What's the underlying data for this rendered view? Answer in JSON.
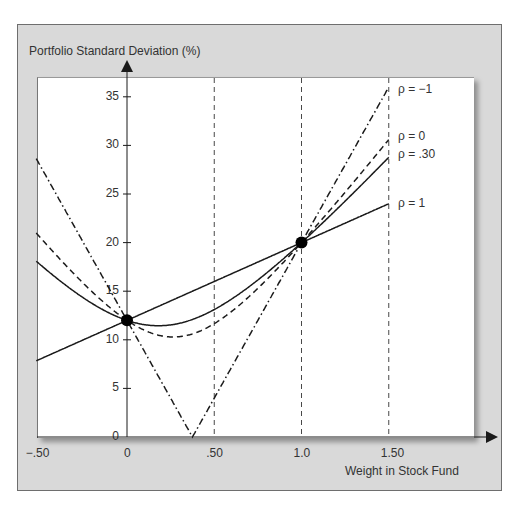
{
  "chart_data": {
    "type": "line",
    "title": "",
    "ylabel": "Portfolio Standard Deviation (%)",
    "xlabel": "Weight in Stock Fund",
    "xlim": [
      -0.5,
      1.8
    ],
    "ylim": [
      0,
      37
    ],
    "x_ticks": [
      -0.5,
      0,
      0.5,
      1.0,
      1.5
    ],
    "x_tick_labels": [
      "−.50",
      "0",
      ".50",
      "1.0",
      "1.50"
    ],
    "y_ticks": [
      0,
      5,
      10,
      15,
      20,
      25,
      30,
      35
    ],
    "y_tick_labels": [
      "0",
      "5",
      "10",
      "15",
      "20",
      "25",
      "30",
      "35"
    ],
    "vertical_reference_lines": [
      0.5,
      1.0,
      1.5
    ],
    "grid": false,
    "legend_position": "inline-right",
    "series_params": {
      "sigma_bond": 12,
      "sigma_stock": 20
    },
    "series": [
      {
        "name": "ρ = −1",
        "rho": -1,
        "style": "dash-dot",
        "x": [
          -0.52,
          0,
          0.375,
          1.0,
          1.5
        ],
        "values": [
          28.2,
          12,
          0,
          20,
          36
        ]
      },
      {
        "name": "ρ = 0",
        "rho": 0,
        "style": "dashed",
        "x": [
          -0.52,
          0,
          0.265,
          0.5,
          1.0,
          1.5
        ],
        "values": [
          20.4,
          12,
          10.3,
          11.7,
          20,
          31.0
        ]
      },
      {
        "name": "ρ = .30",
        "rho": 0.3,
        "style": "solid",
        "x": [
          -0.52,
          0,
          0.18,
          0.5,
          1.0,
          1.5
        ],
        "values": [
          17.6,
          12,
          11.4,
          13.4,
          20,
          29.1
        ]
      },
      {
        "name": "ρ = 1",
        "rho": 1,
        "style": "solid",
        "x": [
          -0.52,
          0,
          1.0,
          1.5
        ],
        "values": [
          7.8,
          12,
          20,
          24
        ]
      }
    ],
    "points": [
      {
        "x": 0,
        "y": 12,
        "label": ""
      },
      {
        "x": 1.0,
        "y": 20,
        "label": ""
      }
    ],
    "annotations": [
      "ρ = −1",
      "ρ = 0",
      "ρ = .30",
      "ρ = 1"
    ]
  },
  "colors": {
    "frame_bg": "#d9d9d9",
    "plot_bg": "#ffffff",
    "ink": "#1a1a1a"
  }
}
